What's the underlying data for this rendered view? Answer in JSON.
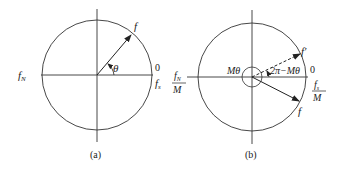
{
  "panel_a": {
    "caption": "(a)",
    "labels": {
      "vector": "f",
      "angle": "θ",
      "zero": "0",
      "fs": "f",
      "fs_sub": "s",
      "fN": "f",
      "fN_sub": "N"
    }
  },
  "panel_b": {
    "caption": "(b)",
    "labels": {
      "vector_dashed": "f′",
      "vector_solid": "f",
      "angle_M": "Mθ",
      "angle_2pi": "2π−Mθ",
      "zero": "0",
      "fs_num": "f",
      "fs_sub": "s",
      "fs_den": "M",
      "fN_num": "f",
      "fN_sub": "N",
      "fN_den": "M"
    }
  }
}
